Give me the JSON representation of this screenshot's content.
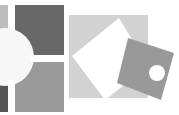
{
  "canvas": {
    "width": 179,
    "height": 115,
    "background": "#ffffff"
  },
  "left_graphic": {
    "name": "quadrant-squares-with-circle",
    "colors": {
      "top_left": "#bdbdbd",
      "top_right": "#686868",
      "bottom_left": "#555555",
      "bottom_right": "#9a9a9a",
      "circle": "#f7f7f7"
    }
  },
  "right_graphic": {
    "name": "tilted-squares-with-dot",
    "colors": {
      "back_square": "#d2d2d2",
      "white_square": "#ffffff",
      "gray_square": "#999999",
      "dot": "#ffffff"
    }
  }
}
